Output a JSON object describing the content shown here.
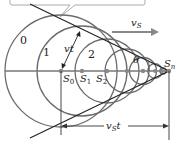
{
  "figure": {
    "colors": {
      "circle": "#6b6b6b",
      "tangent": "#222222",
      "axis": "#777777",
      "arrow": "#888888",
      "callout": "#aaaaaa",
      "point": "#888888"
    },
    "labels": {
      "wavefront_0": "0",
      "wavefront_1": "1",
      "wavefront_2": "2",
      "vt": "vt",
      "vs": "v",
      "vs_sub": "S",
      "theta": "θ",
      "s0": "S",
      "s0_sub": "0",
      "s1": "S",
      "s1_sub": "1",
      "s2": "S",
      "s2_sub": "2",
      "sn": "S",
      "sn_sub": "n",
      "vst": "v",
      "vst_sub": "S",
      "vst_t": "t"
    },
    "source_positions_x": [
      61,
      82,
      107,
      127,
      143,
      155,
      163,
      169
    ],
    "axis_y": 71
  }
}
